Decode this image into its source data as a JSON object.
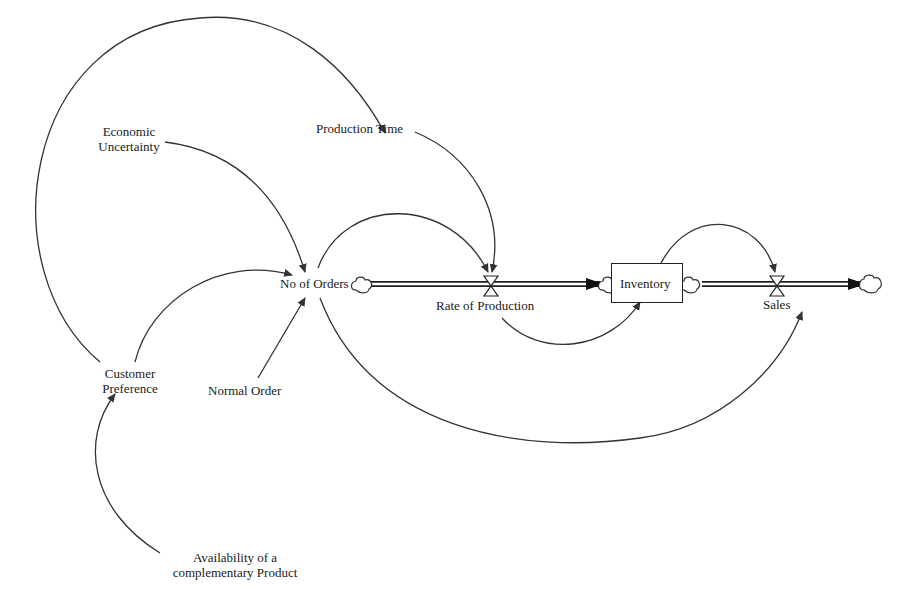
{
  "diagram": {
    "type": "stock-and-flow",
    "nodes": {
      "economic_uncertainty": {
        "line1": "Economic",
        "line2": "Uncertainty"
      },
      "production_time": {
        "label": "Production Time"
      },
      "no_of_orders": {
        "label": "No of Orders"
      },
      "rate_of_production": {
        "label": "Rate of Production"
      },
      "inventory": {
        "label": "Inventory"
      },
      "sales": {
        "label": "Sales"
      },
      "customer_preference": {
        "line1": "Customer",
        "line2": "Preference"
      },
      "normal_order": {
        "label": "Normal Order"
      },
      "availability": {
        "line1": "Availability of a",
        "line2": "complementary Product"
      }
    },
    "links": [
      {
        "from": "Customer Preference",
        "to": "Production Time"
      },
      {
        "from": "Economic Uncertainty",
        "to": "No of Orders"
      },
      {
        "from": "Customer Preference",
        "to": "No of Orders"
      },
      {
        "from": "Normal Order",
        "to": "No of Orders"
      },
      {
        "from": "Production Time",
        "to": "Rate of Production"
      },
      {
        "from": "No of Orders",
        "to": "Rate of Production"
      },
      {
        "from": "Rate of Production",
        "to": "Inventory"
      },
      {
        "from": "Inventory",
        "to": "Sales"
      },
      {
        "from": "No of Orders",
        "to": "Sales"
      },
      {
        "from": "Availability of a complementary Product",
        "to": "Customer Preference"
      }
    ],
    "flows": [
      {
        "from": "No of Orders (source)",
        "via": "Rate of Production",
        "to": "Inventory"
      },
      {
        "from": "Inventory",
        "via": "Sales",
        "to": "sink"
      }
    ],
    "colors": {
      "line": "#333333",
      "background": "#ffffff"
    }
  }
}
